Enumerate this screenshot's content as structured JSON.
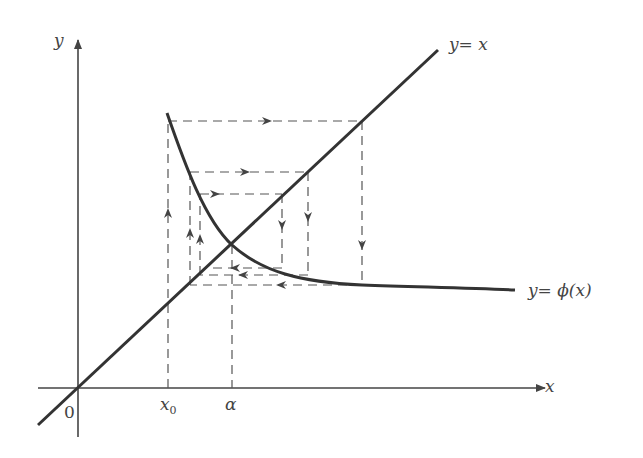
{
  "diagram": {
    "labels": {
      "y_axis": "y",
      "x_axis": "x",
      "origin": "0",
      "x0": "x",
      "x0_sub": "0",
      "alpha": "α",
      "line_label": "y= x",
      "curve_label": "y= ϕ(x)"
    },
    "colors": {
      "axis": "#444444",
      "curve": "#333333",
      "dashed": "#555555",
      "text": "#444444"
    },
    "elements": {
      "axes": [
        "x-axis",
        "y-axis"
      ],
      "line": "y = x",
      "curve": "y = phi(x), decreasing, crossing y=x at alpha",
      "cobweb": "dashed iteration path starting at x0 spiraling into alpha"
    }
  }
}
